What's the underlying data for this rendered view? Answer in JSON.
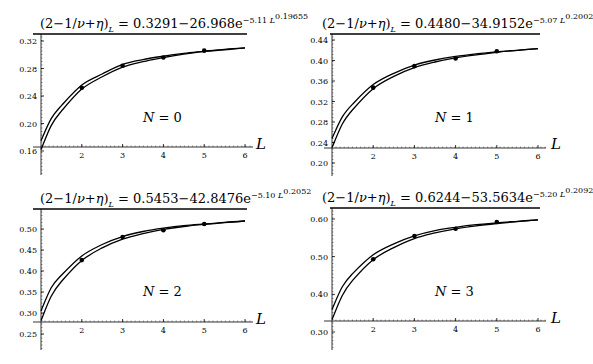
{
  "chart_data": [
    {
      "type": "line",
      "panel": "N=0",
      "title": "(2-1/ν+η)_L = 0.3291-26.968e^{-5.11 L^{0.19655}}",
      "fit": {
        "a": "0.3291",
        "b": "26.968",
        "c": "5.11",
        "d": "0.19655"
      },
      "label": "N = 0",
      "n_value": "0",
      "xlabel": "L",
      "ylabel": "",
      "x_ticks": [
        "2",
        "3",
        "4",
        "5",
        "6"
      ],
      "y_ticks": [
        "0.32",
        "0.28",
        "0.24",
        "0.20",
        "0.16"
      ],
      "xlim": [
        1,
        6
      ],
      "ylim": [
        0.13,
        0.335
      ],
      "x_axis_y": 0.16,
      "points": {
        "x": [
          2,
          3,
          4,
          5
        ],
        "y": [
          0.252,
          0.284,
          0.296,
          0.306
        ]
      },
      "series": [
        {
          "name": "upper curve",
          "x": [
            1,
            1.25,
            1.5,
            2,
            2.5,
            3,
            3.5,
            4,
            4.5,
            5,
            5.5,
            6
          ],
          "y": [
            0.175,
            0.207,
            0.226,
            0.256,
            0.272,
            0.286,
            0.293,
            0.298,
            0.302,
            0.305,
            0.308,
            0.31
          ]
        },
        {
          "name": "lower curve",
          "x": [
            1,
            1.25,
            1.5,
            2,
            2.5,
            3,
            3.5,
            4,
            4.5,
            5,
            5.5,
            6
          ],
          "y": [
            0.162,
            0.197,
            0.218,
            0.25,
            0.268,
            0.282,
            0.29,
            0.296,
            0.301,
            0.305,
            0.307,
            0.31
          ]
        }
      ]
    },
    {
      "type": "line",
      "panel": "N=1",
      "title": "(2-1/ν+η)_L = 0.4480-34.9152e^{-5.07 L^{0.2002}}",
      "fit": {
        "a": "0.4480",
        "b": "34.9152",
        "c": "5.07",
        "d": "0.2002"
      },
      "label": "N = 1",
      "n_value": "1",
      "xlabel": "L",
      "ylabel": "",
      "x_ticks": [
        "2",
        "3",
        "4",
        "5",
        "6"
      ],
      "y_ticks": [
        "0.44",
        "0.40",
        "0.36",
        "0.32",
        "0.28",
        "0.24",
        "0.20"
      ],
      "xlim": [
        1,
        6
      ],
      "ylim": [
        0.18,
        0.45
      ],
      "x_axis_y": 0.228,
      "points": {
        "x": [
          2,
          3,
          4,
          5
        ],
        "y": [
          0.347,
          0.389,
          0.404,
          0.418
        ]
      },
      "series": [
        {
          "name": "upper curve",
          "x": [
            1,
            1.25,
            1.5,
            2,
            2.5,
            3,
            3.5,
            4,
            4.5,
            5,
            5.5,
            6
          ],
          "y": [
            0.248,
            0.29,
            0.315,
            0.353,
            0.375,
            0.391,
            0.401,
            0.408,
            0.413,
            0.417,
            0.42,
            0.423
          ]
        },
        {
          "name": "lower curve",
          "x": [
            1,
            1.25,
            1.5,
            2,
            2.5,
            3,
            3.5,
            4,
            4.5,
            5,
            5.5,
            6
          ],
          "y": [
            0.23,
            0.276,
            0.304,
            0.345,
            0.369,
            0.386,
            0.397,
            0.405,
            0.411,
            0.416,
            0.42,
            0.423
          ]
        }
      ]
    },
    {
      "type": "line",
      "panel": "N=2",
      "title": "(2-1/ν+η)_L = 0.5453-42.8476e^{-5.10 L^{0.2052}}",
      "fit": {
        "a": "0.5453",
        "b": "42.8476",
        "c": "5.10",
        "d": "0.2052"
      },
      "label": "N = 2",
      "n_value": "2",
      "xlabel": "L",
      "ylabel": "",
      "x_ticks": [
        "2",
        "3",
        "4",
        "5",
        "6"
      ],
      "y_ticks": [
        "0.50",
        "0.45",
        "0.40",
        "0.35",
        "0.30",
        "0.25"
      ],
      "xlim": [
        1,
        6
      ],
      "ylim": [
        0.22,
        0.54
      ],
      "x_axis_y": 0.28,
      "points": {
        "x": [
          2,
          3,
          4,
          5
        ],
        "y": [
          0.426,
          0.481,
          0.497,
          0.512
        ]
      },
      "series": [
        {
          "name": "upper curve",
          "x": [
            1,
            1.25,
            1.5,
            2,
            2.5,
            3,
            3.5,
            4,
            4.5,
            5,
            5.5,
            6
          ],
          "y": [
            0.305,
            0.36,
            0.39,
            0.436,
            0.463,
            0.482,
            0.494,
            0.502,
            0.508,
            0.512,
            0.516,
            0.519
          ]
        },
        {
          "name": "lower curve",
          "x": [
            1,
            1.25,
            1.5,
            2,
            2.5,
            3,
            3.5,
            4,
            4.5,
            5,
            5.5,
            6
          ],
          "y": [
            0.282,
            0.34,
            0.375,
            0.425,
            0.455,
            0.476,
            0.489,
            0.499,
            0.506,
            0.511,
            0.515,
            0.519
          ]
        }
      ]
    },
    {
      "type": "line",
      "panel": "N=3",
      "title": "(2-1/ν+η)_L = 0.6244-53.5634e^{-5.20 L^{0.2092}}",
      "fit": {
        "a": "0.6244",
        "b": "53.5634",
        "c": "5.20",
        "d": "0.2092"
      },
      "label": "N = 3",
      "n_value": "3",
      "xlabel": "L",
      "ylabel": "",
      "x_ticks": [
        "2",
        "3",
        "4",
        "5",
        "6"
      ],
      "y_ticks": [
        "0.60",
        "0.50",
        "0.40",
        "0.30"
      ],
      "xlim": [
        1,
        6
      ],
      "ylim": [
        0.25,
        0.63
      ],
      "x_axis_y": 0.33,
      "points": {
        "x": [
          2,
          3,
          4,
          5
        ],
        "y": [
          0.493,
          0.555,
          0.574,
          0.592
        ]
      },
      "series": [
        {
          "name": "upper curve",
          "x": [
            1,
            1.25,
            1.5,
            2,
            2.5,
            3,
            3.5,
            4,
            4.5,
            5,
            5.5,
            6
          ],
          "y": [
            0.36,
            0.42,
            0.455,
            0.505,
            0.534,
            0.555,
            0.569,
            0.578,
            0.585,
            0.59,
            0.594,
            0.598
          ]
        },
        {
          "name": "lower curve",
          "x": [
            1,
            1.25,
            1.5,
            2,
            2.5,
            3,
            3.5,
            4,
            4.5,
            5,
            5.5,
            6
          ],
          "y": [
            0.333,
            0.397,
            0.437,
            0.492,
            0.524,
            0.548,
            0.563,
            0.574,
            0.582,
            0.588,
            0.593,
            0.598
          ]
        }
      ]
    }
  ],
  "layout": {
    "panels": [
      {
        "left": 0,
        "top": 0,
        "axis_x0": 41,
        "axis_x6": 245,
        "axis_end": 253,
        "top_line_y": 34,
        "top_line_x0": 33,
        "top_line_x1": 247,
        "y_top_px": 41,
        "y_top_val": 0.32,
        "y_bot_px": 151,
        "y_bot_val": 0.16,
        "axis_bottom": 175,
        "x_axis_px": 147,
        "title_x": 40,
        "title_y": 12,
        "nlabel_x": 143,
        "nlabel_y": 110,
        "xlabel_x": 256,
        "xlabel_y": 135
      },
      {
        "left": 0,
        "top": 0,
        "axis_x0": 332,
        "axis_x6": 538,
        "axis_end": 546,
        "top_line_y": 34,
        "top_line_x0": 330,
        "top_line_x1": 540,
        "y_top_px": 40,
        "y_top_val": 0.44,
        "y_bot_px": 163,
        "y_bot_val": 0.2,
        "axis_bottom": 176,
        "x_axis_px": 148,
        "title_x": 322,
        "title_y": 12,
        "nlabel_x": 435,
        "nlabel_y": 110,
        "xlabel_x": 551,
        "xlabel_y": 135
      },
      {
        "left": 0,
        "top": 0,
        "axis_x0": 41,
        "axis_x6": 245,
        "axis_end": 253,
        "top_line_y": 209,
        "top_line_x0": 33,
        "top_line_x1": 247,
        "y_top_px": 229,
        "y_top_val": 0.5,
        "y_bot_px": 334,
        "y_bot_val": 0.25,
        "axis_bottom": 350,
        "x_axis_px": 322,
        "title_x": 40,
        "title_y": 187,
        "nlabel_x": 143,
        "nlabel_y": 284,
        "xlabel_x": 256,
        "xlabel_y": 310
      },
      {
        "left": 0,
        "top": 0,
        "axis_x0": 332,
        "axis_x6": 538,
        "axis_end": 546,
        "top_line_y": 208,
        "top_line_x0": 330,
        "top_line_x1": 540,
        "y_top_px": 219,
        "y_top_val": 0.6,
        "y_bot_px": 332,
        "y_bot_val": 0.3,
        "axis_bottom": 350,
        "x_axis_px": 321,
        "title_x": 322,
        "title_y": 186,
        "nlabel_x": 435,
        "nlabel_y": 284,
        "xlabel_x": 551,
        "xlabel_y": 309
      }
    ]
  },
  "labels": {
    "title_prefix": "(2−1/",
    "title_nu": "ν",
    "title_plus": "+",
    "title_eta": "η",
    "title_close": ")",
    "title_sub": "L",
    "title_eq": " = ",
    "title_minus": "−",
    "title_e": "e",
    "title_exp_minus": "−",
    "title_exp_L": "L",
    "n_symbol": "N",
    "n_eq": " = "
  },
  "colors": {
    "line": "#000000",
    "axis": "#000000",
    "background": "#ffffff"
  }
}
